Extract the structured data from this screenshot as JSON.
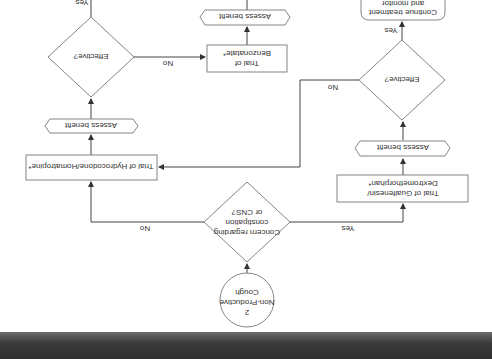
{
  "orientation": "rotated-180",
  "flowchart": {
    "start": {
      "number": "2",
      "line1": "Non-Productive",
      "line2": "Cough"
    },
    "decision_concern": {
      "line1": "Concern regarding",
      "line2": "constipation",
      "line3": "or CNS?"
    },
    "trial_hydrocodone": {
      "label": "Trial of Hydrocodone/Homatropine*"
    },
    "assess_left": {
      "label": "Assess benefit"
    },
    "effective_left": {
      "label": "Effective?"
    },
    "trial_benzonatate": {
      "line1": "Trial of",
      "line2": "Benzonatate*"
    },
    "assess_top": {
      "label": "Assess benefit"
    },
    "trial_guaifenesin": {
      "line1": "Trial of Guaifenesin/",
      "line2": "Dextromethorphan*"
    },
    "assess_right": {
      "label": "Assess benefit"
    },
    "effective_right": {
      "label": "Effective?"
    },
    "continue": {
      "line1": "Continue treatment",
      "line2": "and monitor"
    },
    "edges": {
      "concern_no": "No",
      "concern_yes": "Yes",
      "effective_left_no": "No",
      "effective_left_yes": "Yes",
      "effective_right_no": "No",
      "effective_right_yes": "Yes"
    }
  },
  "colors": {
    "line": "#444444",
    "shape_stroke": "#777777",
    "text": "#333333",
    "band": "#333333"
  }
}
